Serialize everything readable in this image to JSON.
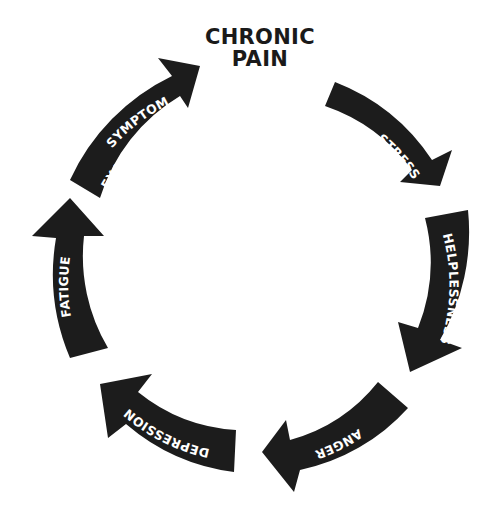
{
  "title": {
    "line1": "CHRONIC",
    "line2": "PAIN"
  },
  "colors": {
    "arrow_fill": "#1c1c1c",
    "arrow_text": "#ffffff",
    "title_text": "#1a1a1a",
    "background": "#ffffff"
  },
  "cycle": [
    {
      "id": "stress",
      "label": "STRESS"
    },
    {
      "id": "helplessness",
      "label": "HELPLESSNESS"
    },
    {
      "id": "anger",
      "label": "ANGER"
    },
    {
      "id": "depression",
      "label": "DEPRESSION"
    },
    {
      "id": "fatigue",
      "label": "FATIGUE"
    },
    {
      "id": "symptom-exacerbation",
      "label_line1": "SYMPTOM",
      "label_line2": "EXACERBATION"
    }
  ]
}
